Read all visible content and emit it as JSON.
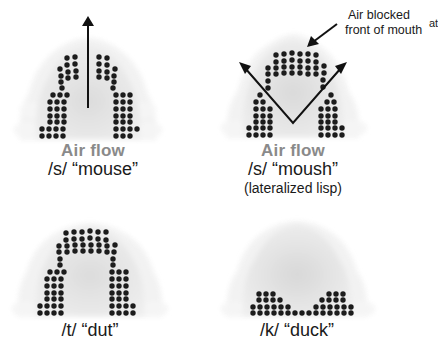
{
  "figure": {
    "panels": [
      {
        "id": "s-mouse",
        "airflow_label": "Air flow",
        "phoneme_label": "/s/ “mouse”",
        "sublabel": "",
        "arrow": "center-up",
        "contact_pattern": "lateral contact, central groove open"
      },
      {
        "id": "s-moush",
        "airflow_label": "Air flow",
        "phoneme_label": "/s/ “moush”",
        "sublabel": "(lateralized lisp)",
        "arrow": "diagonal-sides",
        "contact_pattern": "front closure, lateral escape",
        "annotation": {
          "line1": "Air blocked",
          "line2_main": "front of mouth",
          "line2_superscript": "at"
        }
      },
      {
        "id": "t-dut",
        "airflow_label": "",
        "phoneme_label": "/t/ “dut”",
        "sublabel": "",
        "arrow": "none",
        "contact_pattern": "full alveolar closure"
      },
      {
        "id": "k-duck",
        "airflow_label": "",
        "phoneme_label": "/k/ “duck”",
        "sublabel": "",
        "arrow": "none",
        "contact_pattern": "velar closure at back"
      }
    ],
    "colors": {
      "dot": "#1c1c1c",
      "arrow": "#111111",
      "airflow_text": "#8a8a8a",
      "palate_fill": "#e6e6e6",
      "teeth_fill": "#f2f2f2"
    }
  }
}
